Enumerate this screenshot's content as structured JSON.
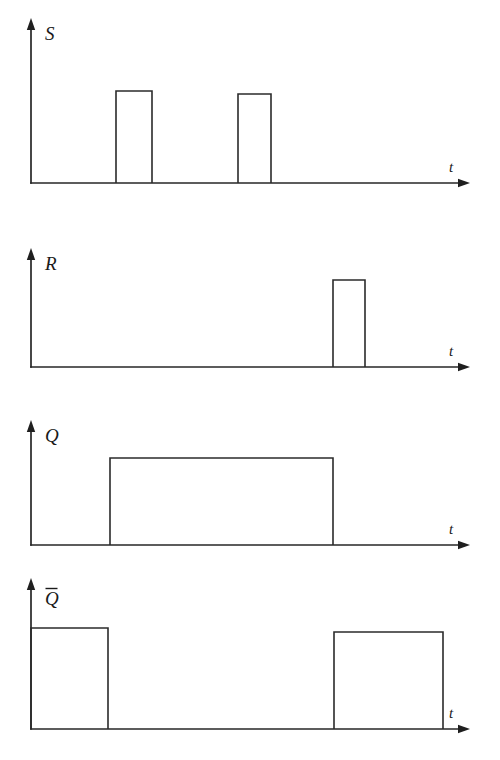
{
  "figure": {
    "background_color": "#ffffff",
    "line_color": "#2b2b2b",
    "label_color": "#1a1a1a",
    "width": 500,
    "height": 760
  },
  "panels": [
    {
      "id": "s",
      "signal_label": "S",
      "overline": false,
      "time_axis_label": "t",
      "axis": {
        "origin_x": 31,
        "baseline_y": 183,
        "v_axis_top_y": 18,
        "h_axis_end_x": 470
      },
      "high_y": 91,
      "label_x": 45,
      "label_y": 40,
      "t_label_x": 449,
      "t_label_y": 172,
      "pulses": [
        {
          "start_x": 116,
          "end_x": 152,
          "top_y": 91
        },
        {
          "start_x": 238,
          "end_x": 271,
          "top_y": 94
        }
      ],
      "starts_high": false,
      "ends_high": false
    },
    {
      "id": "r",
      "signal_label": "R",
      "overline": false,
      "time_axis_label": "t",
      "axis": {
        "origin_x": 31,
        "baseline_y": 367,
        "v_axis_top_y": 248,
        "h_axis_end_x": 470
      },
      "high_y": 280,
      "label_x": 45,
      "label_y": 270,
      "t_label_x": 449,
      "t_label_y": 356,
      "pulses": [
        {
          "start_x": 333,
          "end_x": 365,
          "top_y": 280
        }
      ],
      "starts_high": false,
      "ends_high": false
    },
    {
      "id": "q",
      "signal_label": "Q",
      "overline": false,
      "time_axis_label": "t",
      "axis": {
        "origin_x": 31,
        "baseline_y": 545,
        "v_axis_top_y": 420,
        "h_axis_end_x": 470
      },
      "high_y": 458,
      "label_x": 45,
      "label_y": 442,
      "t_label_x": 449,
      "t_label_y": 534,
      "pulses": [
        {
          "start_x": 110,
          "end_x": 333,
          "top_y": 458
        }
      ],
      "starts_high": false,
      "ends_high": false
    },
    {
      "id": "qbar",
      "signal_label": "Q",
      "overline": true,
      "time_axis_label": "t",
      "axis": {
        "origin_x": 31,
        "baseline_y": 729,
        "v_axis_top_y": 578,
        "h_axis_end_x": 470
      },
      "high_y": 628,
      "label_x": 45,
      "label_y": 605,
      "t_label_x": 449,
      "t_label_y": 718,
      "pulses": [
        {
          "start_x": 31,
          "end_x": 108,
          "top_y": 628
        },
        {
          "start_x": 334,
          "end_x": 443,
          "top_y": 632
        }
      ],
      "starts_high": true,
      "ends_high": true
    }
  ],
  "chart_data": {
    "type": "line",
    "xlabel": "t",
    "ylabel": "",
    "grid": false,
    "legend": "none",
    "x_range": [
      31,
      470
    ],
    "y_levels": {
      "low": 0,
      "high": 1
    },
    "series": [
      {
        "name": "S",
        "type": "digital",
        "initial_level": 0,
        "transitions": [
          {
            "x": 116,
            "level": 1
          },
          {
            "x": 152,
            "level": 0
          },
          {
            "x": 238,
            "level": 1
          },
          {
            "x": 271,
            "level": 0
          }
        ],
        "values": [
          0,
          1,
          0,
          1,
          0
        ]
      },
      {
        "name": "R",
        "type": "digital",
        "initial_level": 0,
        "transitions": [
          {
            "x": 333,
            "level": 1
          },
          {
            "x": 365,
            "level": 0
          }
        ],
        "values": [
          0,
          1,
          0
        ]
      },
      {
        "name": "Q",
        "type": "digital",
        "initial_level": 0,
        "transitions": [
          {
            "x": 110,
            "level": 1
          },
          {
            "x": 333,
            "level": 0
          }
        ],
        "values": [
          0,
          1,
          0
        ]
      },
      {
        "name": "Q̄",
        "type": "digital",
        "initial_level": 1,
        "transitions": [
          {
            "x": 108,
            "level": 0
          },
          {
            "x": 334,
            "level": 1
          }
        ],
        "values": [
          1,
          0,
          1
        ]
      }
    ]
  }
}
